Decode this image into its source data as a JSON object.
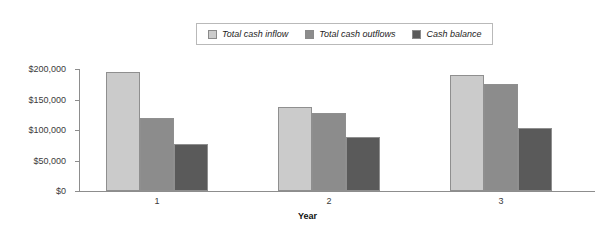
{
  "chart_data": {
    "type": "bar",
    "title": "",
    "xlabel": "Year",
    "ylabel": "",
    "categories": [
      "1",
      "2",
      "3"
    ],
    "series": [
      {
        "name": "Total cash inflow",
        "color": "#cbcbcb",
        "values": [
          195000,
          138000,
          190000
        ]
      },
      {
        "name": "Total cash outflows",
        "color": "#8c8c8c",
        "values": [
          120000,
          128000,
          175000
        ]
      },
      {
        "name": "Cash balance",
        "color": "#5a5a5a",
        "values": [
          77000,
          88000,
          103000
        ]
      }
    ],
    "ylim": [
      0,
      200000
    ],
    "ytick_values": [
      0,
      50000,
      100000,
      150000,
      200000
    ],
    "ytick_labels": [
      "$0",
      "$50,000",
      "$100,000",
      "$150,000",
      "$200,000"
    ],
    "grid": false,
    "legend_position": "top-center"
  },
  "legend": {
    "items": [
      {
        "label": "Total cash inflow",
        "color": "#cbcbcb"
      },
      {
        "label": "Total cash outflows",
        "color": "#8c8c8c"
      },
      {
        "label": "Cash balance",
        "color": "#5a5a5a"
      }
    ]
  },
  "axis": {
    "x_title": "Year",
    "x_labels": [
      "1",
      "2",
      "3"
    ],
    "y_labels": [
      "$200,000",
      "$150,000",
      "$100,000",
      "$50,000",
      "$0"
    ]
  }
}
